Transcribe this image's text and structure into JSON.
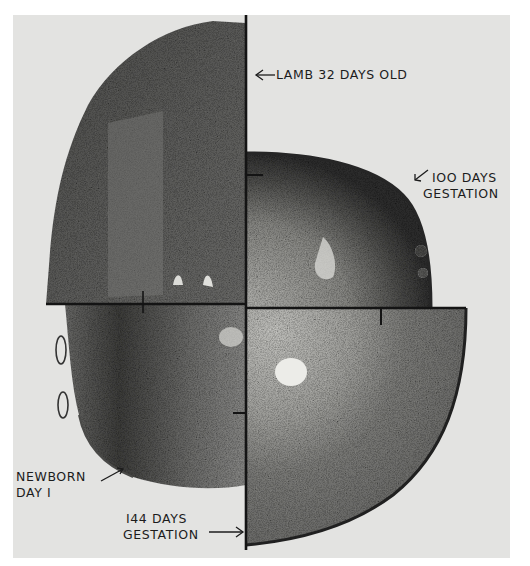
{
  "figure": {
    "type": "composite photomicrograph plate",
    "colors": {
      "page": "#ffffff",
      "plate_background": "#e3e3e1",
      "tissue_dark": "#3a3a3a",
      "tissue_mid": "#6e6e6e",
      "tissue_light": "#b9b9b6",
      "line": "#141414",
      "text": "#1c1c1c"
    },
    "quadrants": [
      {
        "position": "top-left",
        "label_id": "lamb_32_days"
      },
      {
        "position": "top-right",
        "label_id": "gestation_100"
      },
      {
        "position": "bottom-left",
        "label_id": "newborn_day1"
      },
      {
        "position": "bottom-right",
        "label_id": "gestation_144"
      }
    ]
  },
  "labels": {
    "lamb_32_days": {
      "text": "LAMB 32  DAYS OLD",
      "arrow": "left"
    },
    "gestation_100": {
      "line1": "IOO DAYS",
      "line2": "GESTATION",
      "arrow": "down-left"
    },
    "newborn_day1": {
      "line1": "NEWBORN",
      "line2": "DAY I",
      "arrow": "up-right"
    },
    "gestation_144": {
      "line1": "I44 DAYS",
      "line2": "GESTATION",
      "arrow": "right"
    }
  }
}
